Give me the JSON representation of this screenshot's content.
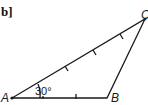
{
  "figure": {
    "part_label": "b]",
    "vertices": {
      "A": {
        "label": "A",
        "x": 12,
        "y": 98
      },
      "B": {
        "label": "B",
        "x": 107,
        "y": 98
      },
      "C": {
        "label": "C",
        "x": 145,
        "y": 19
      }
    },
    "angle_label": "30°",
    "angle_at": "A",
    "tick_marks": {
      "AC": 3,
      "AB": 1
    },
    "colors": {
      "stroke": "#1a1a1a",
      "background": "#ffffff"
    }
  }
}
